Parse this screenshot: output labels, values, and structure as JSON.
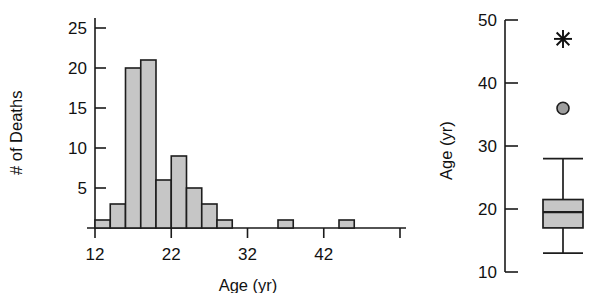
{
  "figure": {
    "background": "#ffffff",
    "bar_fill": "#c6c6c6",
    "bar_stroke": "#1d1d1d",
    "outlier_fill": "#9e9e9e"
  },
  "chart_data": [
    {
      "type": "bar",
      "panel": "left",
      "title": "",
      "xlabel": "Age (yr)",
      "ylabel": "# of Deaths",
      "grid": false,
      "legend": "none",
      "bin_width": 2,
      "xlim": [
        12,
        52
      ],
      "ylim": [
        0,
        26
      ],
      "xticks": [
        12,
        22,
        32,
        42,
        52
      ],
      "xtick_labels": [
        "12",
        "22",
        "32",
        "42",
        ""
      ],
      "yticks": [
        5,
        10,
        15,
        20,
        25
      ],
      "ytick_labels": [
        "5",
        "10",
        "15",
        "20",
        "25"
      ],
      "bin_starts": [
        12,
        14,
        16,
        18,
        20,
        22,
        24,
        26,
        28,
        30,
        32,
        34,
        36,
        38,
        40,
        42,
        44,
        46,
        48,
        50
      ],
      "values": [
        1,
        3,
        20,
        21,
        6,
        9,
        5,
        3,
        1,
        0,
        0,
        0,
        1,
        0,
        0,
        0,
        1,
        0,
        0,
        0
      ],
      "categories": [
        "12-14",
        "14-16",
        "16-18",
        "18-20",
        "20-22",
        "22-24",
        "24-26",
        "26-28",
        "28-30",
        "30-32",
        "32-34",
        "34-36",
        "36-38",
        "38-40",
        "40-42",
        "42-44",
        "44-46",
        "46-48",
        "48-50",
        "50-52"
      ]
    },
    {
      "type": "box",
      "panel": "right",
      "title": "",
      "xlabel": "",
      "ylabel": "Age (yr)",
      "grid": false,
      "legend": "none",
      "ylim": [
        10,
        50
      ],
      "yticks": [
        10,
        20,
        30,
        40,
        50
      ],
      "ytick_labels": [
        "10",
        "20",
        "30",
        "40",
        "50"
      ],
      "box": {
        "lower_whisker": 13,
        "q1": 17,
        "median": 19.5,
        "q3": 21.5,
        "upper_whisker": 28
      },
      "outliers": [
        {
          "value": 36,
          "marker": "circle"
        },
        {
          "value": 47,
          "marker": "asterisk"
        }
      ]
    }
  ],
  "labels": {
    "left_ylabel": "# of Deaths",
    "left_xlabel": "Age (yr)",
    "right_ylabel": "Age (yr)"
  }
}
